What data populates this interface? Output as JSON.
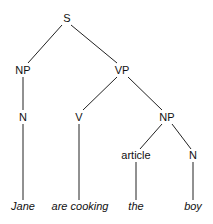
{
  "diagram": {
    "type": "syntax-tree",
    "nodes": {
      "s": {
        "label": "S",
        "x": 67,
        "y": 22
      },
      "np1": {
        "label": "NP",
        "x": 23,
        "y": 74
      },
      "vp": {
        "label": "VP",
        "x": 122,
        "y": 74
      },
      "n1": {
        "label": "N",
        "x": 23,
        "y": 121
      },
      "v": {
        "label": "V",
        "x": 79,
        "y": 121
      },
      "np2": {
        "label": "NP",
        "x": 167,
        "y": 121
      },
      "article": {
        "label": "article",
        "x": 136,
        "y": 159
      },
      "n2": {
        "label": "N",
        "x": 193,
        "y": 159
      }
    },
    "leaves": {
      "jane": {
        "label": "Jane",
        "x": 23,
        "y": 210
      },
      "are_cooking": {
        "label": "are cooking",
        "x": 80,
        "y": 210
      },
      "the": {
        "label": "the",
        "x": 136,
        "y": 210
      },
      "boy": {
        "label": "boy",
        "x": 193,
        "y": 210
      }
    },
    "edges": [
      [
        "S",
        "NP"
      ],
      [
        "S",
        "VP"
      ],
      [
        "NP",
        "N"
      ],
      [
        "VP",
        "V"
      ],
      [
        "VP",
        "NP"
      ],
      [
        "NP",
        "article"
      ],
      [
        "NP",
        "N"
      ],
      [
        "N",
        "Jane"
      ],
      [
        "V",
        "are cooking"
      ],
      [
        "article",
        "the"
      ],
      [
        "N",
        "boy"
      ]
    ]
  }
}
